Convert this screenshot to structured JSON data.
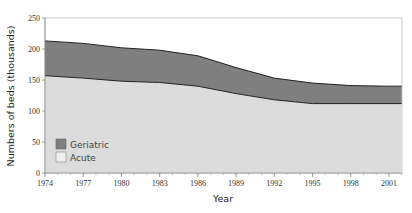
{
  "chart_data": {
    "type": "area",
    "stacked": true,
    "title": "",
    "xlabel": "Year",
    "ylabel": "Numbers of beds (thousands)",
    "ylim": [
      0,
      250
    ],
    "xlim": [
      1974,
      2002
    ],
    "yticks": [
      0,
      50,
      100,
      150,
      200,
      250
    ],
    "xticks": [
      1974,
      1977,
      1980,
      1983,
      1986,
      1989,
      1992,
      1995,
      1998,
      2001
    ],
    "grid": false,
    "legend_position": "inside lower left",
    "x": [
      1974,
      1977,
      1980,
      1983,
      1986,
      1989,
      1992,
      1995,
      1998,
      2001,
      2002
    ],
    "series": [
      {
        "name": "Acute",
        "color": "#dcdcdc",
        "values": [
          157,
          153,
          148,
          146,
          140,
          128,
          118,
          112,
          112,
          112,
          112
        ]
      },
      {
        "name": "Geriatric",
        "color": "#7f7f7f",
        "values": [
          56,
          56,
          54,
          52,
          49,
          42,
          35,
          33,
          29,
          28,
          28
        ]
      }
    ],
    "totals": [
      213,
      209,
      202,
      198,
      189,
      170,
      153,
      145,
      141,
      140,
      140
    ]
  },
  "legend": {
    "items": [
      {
        "label": "Geriatric",
        "color": "#7f7f7f"
      },
      {
        "label": "Acute",
        "color": "#dcdcdc"
      }
    ]
  }
}
